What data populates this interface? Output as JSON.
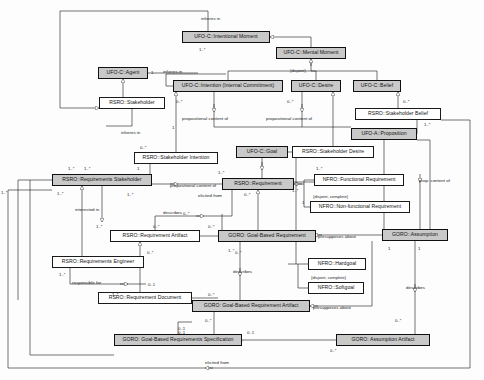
{
  "diagram": {
    "type": "uml-class-diagram",
    "canvas": {
      "width": 484,
      "height": 380
    },
    "palette": {
      "node_fill": "#ffffff",
      "node_fill_shaded": "#c9c9c9",
      "stroke": "#1a1a1a",
      "background": "#fdfdfd"
    }
  },
  "nodes": [
    {
      "id": "intentional_moment",
      "label": "UFO-C::Intentional Moment",
      "shaded": true,
      "x": 182,
      "y": 31,
      "w": 88,
      "h": 12
    },
    {
      "id": "mental_moment",
      "label": "UFO-C::Mental Moment",
      "shaded": true,
      "x": 276,
      "y": 47,
      "w": 70,
      "h": 12
    },
    {
      "id": "agent",
      "label": "UFO-C::Agent",
      "shaded": true,
      "x": 98,
      "y": 67,
      "w": 50,
      "h": 12
    },
    {
      "id": "intention",
      "label": "UFO-C::Intention (Internal Commitment)",
      "shaded": true,
      "x": 173,
      "y": 80,
      "w": 110,
      "h": 12
    },
    {
      "id": "desire",
      "label": "UFO-C::Desire",
      "shaded": true,
      "x": 291,
      "y": 80,
      "w": 50,
      "h": 12
    },
    {
      "id": "belief",
      "label": "UFO-C::Belief",
      "shaded": true,
      "x": 353,
      "y": 80,
      "w": 48,
      "h": 12
    },
    {
      "id": "stakeholder",
      "label": "RSRO::Stakeholder",
      "shaded": false,
      "x": 99,
      "y": 97,
      "w": 66,
      "h": 12
    },
    {
      "id": "stakeholder_belief",
      "label": "RSRO::Stakeholder Belief",
      "shaded": false,
      "x": 355,
      "y": 108,
      "w": 86,
      "h": 12
    },
    {
      "id": "proposition",
      "label": "UFO-A::Proposition",
      "shaded": true,
      "x": 351,
      "y": 128,
      "w": 66,
      "h": 12
    },
    {
      "id": "stakeholder_intention",
      "label": "RSRO::Stakeholder Intention",
      "shaded": false,
      "x": 134,
      "y": 152,
      "w": 84,
      "h": 12
    },
    {
      "id": "goal",
      "label": "UFO-C::Goal",
      "shaded": true,
      "x": 236,
      "y": 146,
      "w": 52,
      "h": 12
    },
    {
      "id": "stakeholder_desire",
      "label": "RSRO::Stakeholder Desire",
      "shaded": false,
      "x": 292,
      "y": 146,
      "w": 82,
      "h": 12
    },
    {
      "id": "req_stakeholder",
      "label": "RSRO::Requirements Stakeholder",
      "shaded": true,
      "x": 52,
      "y": 174,
      "w": 100,
      "h": 12
    },
    {
      "id": "requirement",
      "label": "RSRO::Requirement",
      "shaded": true,
      "x": 222,
      "y": 178,
      "w": 72,
      "h": 12
    },
    {
      "id": "functional_req",
      "label": "NFRO::Functional Requirement",
      "shaded": false,
      "x": 314,
      "y": 174,
      "w": 90,
      "h": 12
    },
    {
      "id": "nonfunctional_req",
      "label": "NFRO::Non-functional Requirement",
      "shaded": false,
      "x": 310,
      "y": 201,
      "w": 100,
      "h": 12
    },
    {
      "id": "req_artifact",
      "label": "RSRO::Requirement Artifact",
      "shaded": false,
      "x": 110,
      "y": 230,
      "w": 90,
      "h": 12
    },
    {
      "id": "goal_based_req",
      "label": "GORO: Goal-Based Requirement",
      "shaded": true,
      "x": 218,
      "y": 230,
      "w": 98,
      "h": 12
    },
    {
      "id": "assumption",
      "label": "GORO::Assumption",
      "shaded": true,
      "x": 382,
      "y": 229,
      "w": 66,
      "h": 12
    },
    {
      "id": "hardgoal",
      "label": "NFRO::Hardgoal",
      "shaded": false,
      "x": 308,
      "y": 258,
      "w": 58,
      "h": 12
    },
    {
      "id": "softgoal",
      "label": "NFRO::Softgoal",
      "shaded": false,
      "x": 308,
      "y": 282,
      "w": 56,
      "h": 12
    },
    {
      "id": "req_engineer",
      "label": "RSRO::Requirements Engineer",
      "shaded": false,
      "x": 52,
      "y": 256,
      "w": 92,
      "h": 12
    },
    {
      "id": "req_document",
      "label": "RSRO::Requirement Document",
      "shaded": false,
      "x": 98,
      "y": 292,
      "w": 94,
      "h": 12
    },
    {
      "id": "gb_req_artifact",
      "label": "GORO: Goal-Based Requirement Artifact",
      "shaded": true,
      "x": 192,
      "y": 300,
      "w": 118,
      "h": 12
    },
    {
      "id": "gb_req_spec",
      "label": "GORO: Goal-Based Requirements Specification",
      "shaded": true,
      "x": 114,
      "y": 334,
      "w": 128,
      "h": 12
    },
    {
      "id": "assumption_artifact",
      "label": "GORO: Assumption Artifact",
      "shaded": true,
      "x": 336,
      "y": 334,
      "w": 94,
      "h": 12
    }
  ],
  "edge_labels": [
    {
      "id": "inheres_in_top",
      "text": "inheres in",
      "x": 201,
      "y": 17
    },
    {
      "id": "inheres_in_agent",
      "text": "inheres in",
      "x": 163,
      "y": 70
    },
    {
      "id": "inheres_in_mid",
      "text": "inheres in",
      "x": 121,
      "y": 131
    },
    {
      "id": "prop_content_1",
      "text": "propositional content of",
      "x": 182,
      "y": 117
    },
    {
      "id": "prop_content_2",
      "text": "propositional content of",
      "x": 266,
      "y": 117
    },
    {
      "id": "prop_content_3",
      "text": "propositional content of",
      "x": 170,
      "y": 184
    },
    {
      "id": "prop_content_right",
      "text": "prop: content of",
      "x": 419,
      "y": 179
    },
    {
      "id": "elicited_from_1",
      "text": "elicited from",
      "x": 198,
      "y": 194
    },
    {
      "id": "describes_1",
      "text": "describes",
      "x": 163,
      "y": 211
    },
    {
      "id": "interested_in",
      "text": "interested in",
      "x": 75,
      "y": 208
    },
    {
      "id": "describes_2",
      "text": "describes",
      "x": 233,
      "y": 270
    },
    {
      "id": "presupposes_1",
      "text": "presupposes about",
      "x": 318,
      "y": 235
    },
    {
      "id": "describes_3",
      "text": "describes",
      "x": 406,
      "y": 286
    },
    {
      "id": "responsible_for",
      "text": "responsible for",
      "x": 72,
      "y": 281
    },
    {
      "id": "presupposes_2",
      "text": "presupposes about",
      "x": 313,
      "y": 306
    },
    {
      "id": "elicited_from_2",
      "text": "elicited from",
      "x": 205,
      "y": 361
    }
  ],
  "constraints": [
    {
      "id": "disjoint_mental",
      "text": "{disjoint}",
      "x": 290,
      "y": 68
    },
    {
      "id": "disjoint_complete_req",
      "text": "{disjoint, complete}",
      "x": 313,
      "y": 194
    },
    {
      "id": "disjoint_complete_goal",
      "text": "{disjoint, complete}",
      "x": 311,
      "y": 275
    }
  ],
  "multiplicities": [
    {
      "id": "m1",
      "text": "1..*",
      "x": 199,
      "y": 47
    },
    {
      "id": "m2",
      "text": "1",
      "x": 151,
      "y": 70
    },
    {
      "id": "m3",
      "text": "0..*",
      "x": 176,
      "y": 99
    },
    {
      "id": "m4",
      "text": "0..*",
      "x": 287,
      "y": 99
    },
    {
      "id": "m5",
      "text": "0..*",
      "x": 403,
      "y": 99
    },
    {
      "id": "m6",
      "text": "1..*",
      "x": 424,
      "y": 122
    },
    {
      "id": "m7",
      "text": "1",
      "x": 172,
      "y": 125
    },
    {
      "id": "m8",
      "text": "0..*",
      "x": 140,
      "y": 145
    },
    {
      "id": "m9",
      "text": "1..*",
      "x": 68,
      "y": 166
    },
    {
      "id": "m10",
      "text": "1..*",
      "x": 84,
      "y": 166
    },
    {
      "id": "m11",
      "text": "1",
      "x": 137,
      "y": 166
    },
    {
      "id": "m12",
      "text": "1..*",
      "x": 1,
      "y": 190
    },
    {
      "id": "m13",
      "text": "1..*",
      "x": 218,
      "y": 170
    },
    {
      "id": "m14",
      "text": "1..*",
      "x": 316,
      "y": 166
    },
    {
      "id": "m15",
      "text": "1..*",
      "x": 57,
      "y": 191
    },
    {
      "id": "m16",
      "text": "1..*",
      "x": 127,
      "y": 192
    },
    {
      "id": "m17",
      "text": "0..*",
      "x": 244,
      "y": 192
    },
    {
      "id": "m18",
      "text": "1..*",
      "x": 292,
      "y": 188
    },
    {
      "id": "m19",
      "text": "1",
      "x": 302,
      "y": 200
    },
    {
      "id": "m20",
      "text": "0..*",
      "x": 183,
      "y": 211
    },
    {
      "id": "m21",
      "text": "0..*",
      "x": 153,
      "y": 224
    },
    {
      "id": "m22",
      "text": "0..*",
      "x": 208,
      "y": 224
    },
    {
      "id": "m23",
      "text": "1..*",
      "x": 96,
      "y": 224
    },
    {
      "id": "m24",
      "text": "1..*",
      "x": 228,
      "y": 248
    },
    {
      "id": "m25",
      "text": "0..*",
      "x": 235,
      "y": 250
    },
    {
      "id": "m26",
      "text": "1",
      "x": 388,
      "y": 246
    },
    {
      "id": "m27",
      "text": "1",
      "x": 418,
      "y": 246
    },
    {
      "id": "m28",
      "text": "0..*",
      "x": 147,
      "y": 250
    },
    {
      "id": "m29",
      "text": "1..*",
      "x": 59,
      "y": 272
    },
    {
      "id": "m30",
      "text": "0..1",
      "x": 148,
      "y": 282
    },
    {
      "id": "m31",
      "text": "0..*",
      "x": 208,
      "y": 292
    },
    {
      "id": "m32",
      "text": "1..*",
      "x": 112,
      "y": 292
    },
    {
      "id": "m33",
      "text": "0..*",
      "x": 205,
      "y": 318
    },
    {
      "id": "m34",
      "text": "0..1",
      "x": 178,
      "y": 326
    },
    {
      "id": "m35",
      "text": "0..1",
      "x": 178,
      "y": 330
    },
    {
      "id": "m36",
      "text": "0..1",
      "x": 247,
      "y": 330
    },
    {
      "id": "m37",
      "text": "0..*",
      "x": 330,
      "y": 348
    },
    {
      "id": "m38",
      "text": "0..*",
      "x": 395,
      "y": 318
    }
  ]
}
